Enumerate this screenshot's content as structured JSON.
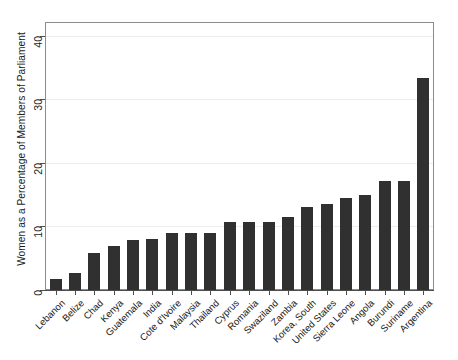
{
  "chart_data": {
    "type": "bar",
    "title": "",
    "subtitle": "",
    "xlabel": "",
    "ylabel": "Women as a Percentage of Members of Parliament",
    "ylim": [
      0,
      42
    ],
    "yticks": [
      0,
      10,
      20,
      30,
      40
    ],
    "ytick_labels": [
      "0",
      "10",
      "20",
      "30",
      "40"
    ],
    "grid": true,
    "grid_axis": "y",
    "legend": false,
    "legend_position": "none",
    "bar_color": "#303030",
    "background_color": "#ffffff",
    "frame_color": "#8c8c8c",
    "gridline_color": "#ededed",
    "categories": [
      "Lebanon",
      "Belize",
      "Chad",
      "Kenya",
      "Guatemala",
      "India",
      "Cote d'Ivoire",
      "Malaysia",
      "Thailand",
      "Cyprus",
      "Romania",
      "Swaziland",
      "Zambia",
      "Korea, South",
      "United States",
      "Sierra Leone",
      "Angola",
      "Burundi",
      "Suriname",
      "Argentina"
    ],
    "values": [
      1.8,
      2.7,
      5.9,
      7.0,
      7.9,
      8.1,
      8.9,
      8.9,
      8.9,
      10.7,
      10.7,
      10.7,
      11.5,
      13.0,
      13.6,
      14.5,
      15.0,
      17.1,
      17.1,
      33.3
    ]
  }
}
